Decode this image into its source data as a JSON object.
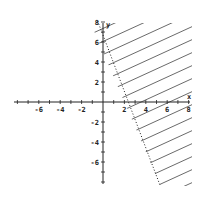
{
  "chart_data": {
    "type": "line",
    "title": "",
    "xlabel": "x",
    "ylabel": "y",
    "xlim": [
      -8,
      8
    ],
    "ylim": [
      -8,
      8
    ],
    "grid": false,
    "x_ticks": [
      -6,
      -4,
      -2,
      2,
      4,
      6,
      8
    ],
    "y_ticks": [
      8,
      6,
      4,
      2,
      -2,
      -4,
      -6
    ],
    "boundary": {
      "equation": "y = -2.5x + 5",
      "style": "dotted",
      "points": [
        [
          -0.5,
          6.25
        ],
        [
          0,
          5
        ],
        [
          2,
          0
        ],
        [
          5.6,
          -9
        ]
      ]
    },
    "shaded_region": "right of boundary (5x + 2y > 10)",
    "shading_style": "diagonal hatch lines",
    "colors": {
      "axis": "#222222",
      "boundary": "#222222",
      "hatch": "#444444",
      "background": "#ffffff"
    }
  },
  "labels": {
    "x_axis": "x",
    "y_axis": "y",
    "x_ticks": [
      "-6",
      "-4",
      "-2",
      "2",
      "4",
      "6",
      "8"
    ],
    "y_ticks": [
      "8",
      "6",
      "4",
      "2",
      "-2",
      "-4",
      "-6"
    ]
  }
}
